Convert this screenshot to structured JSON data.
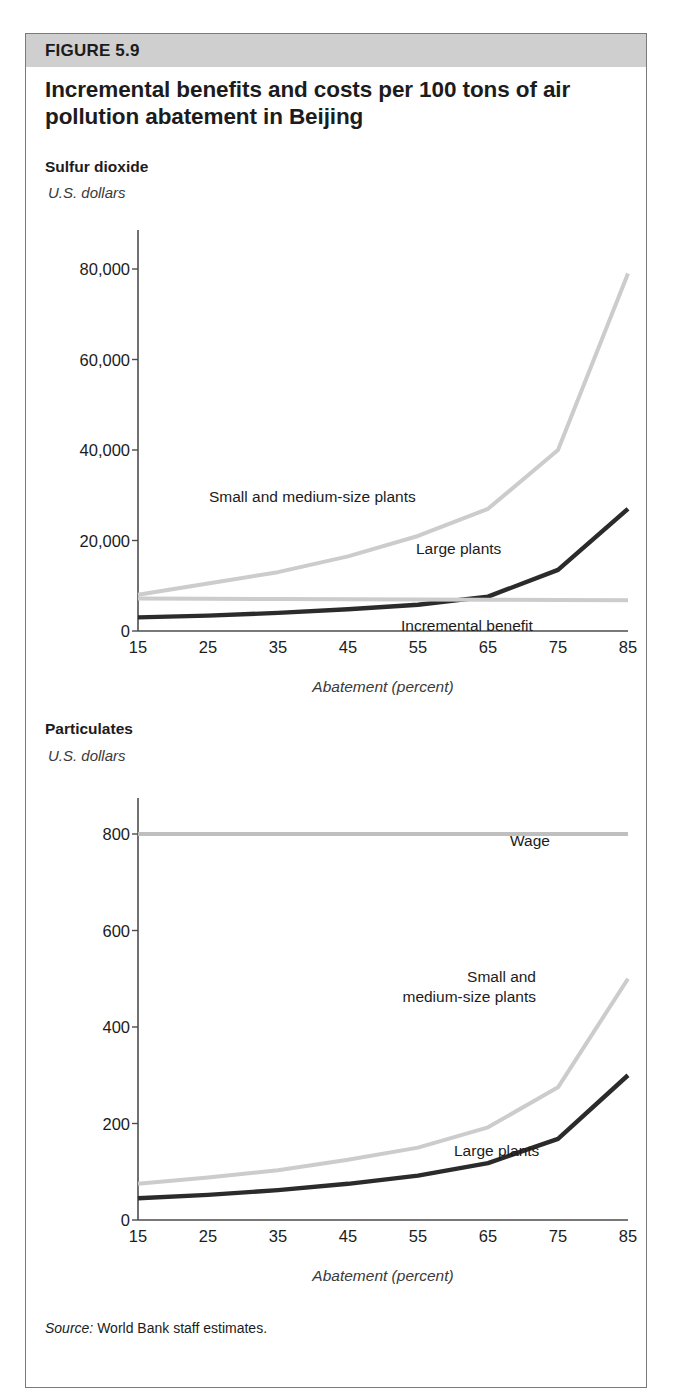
{
  "figure": {
    "number_label": "FIGURE 5.9",
    "title": "Incremental benefits and costs per 100 tons of air pollution abatement in Beijing",
    "source_word": "Source:",
    "source_text": "World Bank staff estimates."
  },
  "colors": {
    "header_bar": "#cfcfcf",
    "border": "#7a7a7a",
    "dark_series": "#2b2b2b",
    "light_series": "#cccccc",
    "mid_series": "#bfbfbf",
    "axis": "#4d4d4d",
    "text": "#1c1c1c"
  },
  "panel1": {
    "heading": "Sulfur dioxide",
    "y_unit": "U.S. dollars",
    "x_title": "Abatement (percent)",
    "labels": {
      "small_medium": "Small and medium-size plants",
      "large": "Large plants",
      "benefit": "Incremental benefit"
    }
  },
  "panel2": {
    "heading": "Particulates",
    "y_unit": "U.S. dollars",
    "x_title": "Abatement (percent)",
    "labels": {
      "wage": "Wage",
      "small_medium_line1": "Small and",
      "small_medium_line2": "medium-size plants",
      "large": "Large plants"
    }
  },
  "chart_data": [
    {
      "type": "line",
      "title": "Sulfur dioxide",
      "xlabel": "Abatement (percent)",
      "ylabel": "U.S. dollars",
      "x": [
        15,
        25,
        35,
        45,
        55,
        65,
        75,
        85
      ],
      "xticks": [
        "15",
        "25",
        "35",
        "45",
        "55",
        "65",
        "75",
        "85"
      ],
      "yticks": [
        "0",
        "20,000",
        "40,000",
        "60,000",
        "80,000"
      ],
      "ytick_values": [
        0,
        20000,
        40000,
        60000,
        80000
      ],
      "xlim": [
        15,
        85
      ],
      "ylim": [
        0,
        80000
      ],
      "grid": false,
      "legend": "inline-annotations",
      "series": [
        {
          "name": "Small and medium-size plants",
          "color": "#cccccc",
          "values": [
            8000,
            10500,
            13000,
            16500,
            21000,
            27000,
            40000,
            79000
          ]
        },
        {
          "name": "Large plants",
          "color": "#2b2b2b",
          "values": [
            3000,
            3400,
            4000,
            4800,
            5800,
            7600,
            13500,
            27000
          ]
        },
        {
          "name": "Incremental benefit",
          "color": "#cccccc",
          "values": [
            7200,
            7100,
            7050,
            7000,
            6950,
            6900,
            6850,
            6800
          ]
        }
      ]
    },
    {
      "type": "line",
      "title": "Particulates",
      "xlabel": "Abatement (percent)",
      "ylabel": "U.S. dollars",
      "x": [
        15,
        25,
        35,
        45,
        55,
        65,
        75,
        85
      ],
      "xticks": [
        "15",
        "25",
        "35",
        "45",
        "55",
        "65",
        "75",
        "85"
      ],
      "yticks": [
        "0",
        "200",
        "400",
        "600",
        "800"
      ],
      "ytick_values": [
        0,
        200,
        400,
        600,
        800
      ],
      "xlim": [
        15,
        85
      ],
      "ylim": [
        0,
        800
      ],
      "grid": false,
      "legend": "inline-annotations",
      "series": [
        {
          "name": "Wage",
          "color": "#bfbfbf",
          "values": [
            800,
            800,
            800,
            800,
            800,
            800,
            800,
            800
          ]
        },
        {
          "name": "Small and medium-size plants",
          "color": "#cccccc",
          "values": [
            75,
            88,
            103,
            125,
            150,
            192,
            275,
            500
          ]
        },
        {
          "name": "Large plants",
          "color": "#2b2b2b",
          "values": [
            45,
            52,
            62,
            75,
            92,
            118,
            168,
            300
          ]
        }
      ]
    }
  ]
}
